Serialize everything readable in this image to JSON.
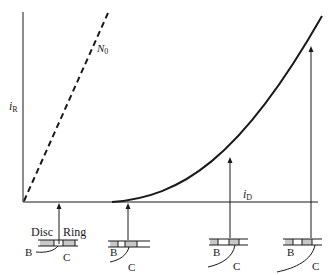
{
  "diagram": {
    "y_axis_label": {
      "main": "i",
      "sub": "R"
    },
    "x_axis_label": {
      "main": "i",
      "sub": "D"
    },
    "dashed_line_label": {
      "main": "N",
      "sub": "0"
    },
    "electrode_labels": {
      "disc": "Disc",
      "ring": "Ring",
      "b": "B",
      "c": "C"
    },
    "stages": [
      {
        "label_b": "B",
        "label_c": "C"
      },
      {
        "label_b": "B",
        "label_c": "C"
      },
      {
        "label_b": "B",
        "label_c": "C"
      },
      {
        "label_b": "B",
        "label_c": "C"
      }
    ],
    "colors": {
      "ink": "#1a1a1a",
      "shade": "#c8c8c8",
      "background": "#ffffff"
    }
  }
}
